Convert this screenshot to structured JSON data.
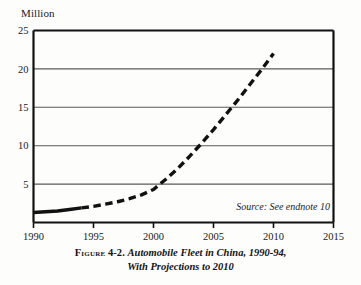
{
  "figure": {
    "unit_label": "Million",
    "source_note": "Source: See endnote 10",
    "caption_figure_word": "Figure",
    "caption_figure_number": "4-2.",
    "caption_line1": "Automobile Fleet in China, 1990-94,",
    "caption_line2": "With Projections to 2010"
  },
  "colors": {
    "line": "#111111",
    "gridline": "#5a5a5a",
    "axis": "#111111",
    "background": "#fdfdfc",
    "text": "#161616"
  },
  "chart_data": {
    "type": "line",
    "title": "Automobile Fleet in China, 1990-94, With Projections to 2010",
    "xlabel": "",
    "ylabel": "Million",
    "xlim": [
      1990,
      2015
    ],
    "ylim": [
      0,
      25
    ],
    "xticks": [
      1990,
      1995,
      2000,
      2005,
      2010,
      2015
    ],
    "xtick_labels": [
      "1990",
      "1995",
      "2000",
      "2005",
      "2010",
      "2015"
    ],
    "yticks": [
      5,
      10,
      15,
      20,
      25
    ],
    "ytick_labels": [
      "5",
      "10",
      "15",
      "20",
      "25"
    ],
    "grid": true,
    "grid_axis": "y",
    "legend": false,
    "annotations": [
      "Source: See endnote 10"
    ],
    "series": [
      {
        "name": "Automobile fleet (actual)",
        "style": "solid",
        "x": [
          1990,
          1991,
          1992,
          1993,
          1994
        ],
        "values": [
          1.3,
          1.4,
          1.5,
          1.7,
          1.9
        ]
      },
      {
        "name": "Automobile fleet (projected)",
        "style": "dashed",
        "x": [
          1994,
          1995,
          1996,
          1997,
          1998,
          1999,
          2000,
          2001,
          2002,
          2003,
          2004,
          2005,
          2006,
          2007,
          2008,
          2009,
          2010
        ],
        "values": [
          1.9,
          2.1,
          2.4,
          2.7,
          3.1,
          3.6,
          4.3,
          5.6,
          7.0,
          8.6,
          10.3,
          12.1,
          14.0,
          15.9,
          17.9,
          19.9,
          22.0
        ]
      }
    ]
  }
}
